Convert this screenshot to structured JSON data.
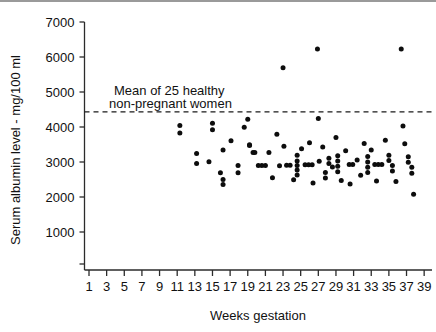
{
  "chart_data": {
    "type": "scatter",
    "title": "",
    "xlabel": "Weeks gestation",
    "ylabel": "Serum albumin level - mg/100 ml",
    "xlim": [
      0,
      40
    ],
    "ylim": [
      0,
      7000
    ],
    "grid": false,
    "legend": "none",
    "xticks": [
      1,
      3,
      5,
      7,
      9,
      11,
      13,
      15,
      17,
      19,
      21,
      23,
      25,
      27,
      29,
      31,
      33,
      35,
      37,
      39
    ],
    "xtick_labels": [
      "1",
      "3",
      "5",
      "7",
      "9",
      "11",
      "13",
      "15",
      "17",
      "19",
      "21",
      "23",
      "25",
      "27",
      "29",
      "31",
      "33",
      "35",
      "37",
      "39"
    ],
    "yticks": [
      1000,
      2000,
      3000,
      4000,
      5000,
      6000,
      7000
    ],
    "ytick_labels": [
      "1000",
      "2000",
      "3000",
      "4000",
      "5000",
      "6000",
      "7000"
    ],
    "annotations": [
      {
        "name": "mean-reference-label",
        "text_line1": "Mean of 25 healthy",
        "text_line2": "non-pregnant women",
        "x": 13.5,
        "y": 4900
      }
    ],
    "reference_lines": [
      {
        "name": "mean-non-pregnant-line",
        "orientation": "horizontal",
        "value": 4430,
        "style": "dashed",
        "label": "Mean of 25 healthy non-pregnant women"
      }
    ],
    "series": [
      {
        "name": "Serum albumin level",
        "marker": "filled-circle",
        "color": "#0d0d0d",
        "points": [
          [
            11.3,
            4040
          ],
          [
            11.3,
            3830
          ],
          [
            13.2,
            3240
          ],
          [
            13.2,
            2960
          ],
          [
            14.6,
            3010
          ],
          [
            15.0,
            4110
          ],
          [
            15.0,
            3920
          ],
          [
            15.9,
            2690
          ],
          [
            16.2,
            3340
          ],
          [
            16.2,
            2500
          ],
          [
            16.2,
            2360
          ],
          [
            17.1,
            3610
          ],
          [
            17.9,
            2900
          ],
          [
            17.9,
            2690
          ],
          [
            18.6,
            3990
          ],
          [
            19.0,
            4220
          ],
          [
            19.2,
            3490
          ],
          [
            19.2,
            3470
          ],
          [
            19.6,
            3270
          ],
          [
            19.8,
            3270
          ],
          [
            20.2,
            2900
          ],
          [
            20.6,
            2900
          ],
          [
            21.0,
            2900
          ],
          [
            21.4,
            3270
          ],
          [
            21.8,
            2550
          ],
          [
            22.3,
            3790
          ],
          [
            22.6,
            2890
          ],
          [
            23.0,
            5690
          ],
          [
            23.1,
            3450
          ],
          [
            23.4,
            2910
          ],
          [
            23.8,
            2910
          ],
          [
            24.2,
            2490
          ],
          [
            24.6,
            3190
          ],
          [
            24.6,
            3030
          ],
          [
            24.6,
            2900
          ],
          [
            24.6,
            2770
          ],
          [
            24.6,
            2630
          ],
          [
            25.1,
            3380
          ],
          [
            25.5,
            2920
          ],
          [
            25.9,
            2920
          ],
          [
            26.3,
            2920
          ],
          [
            26.0,
            3550
          ],
          [
            26.4,
            2400
          ],
          [
            26.9,
            6230
          ],
          [
            27.0,
            4240
          ],
          [
            27.1,
            3020
          ],
          [
            27.5,
            3430
          ],
          [
            27.8,
            2700
          ],
          [
            27.8,
            2540
          ],
          [
            28.2,
            3110
          ],
          [
            28.2,
            2960
          ],
          [
            28.6,
            2860
          ],
          [
            29.0,
            3700
          ],
          [
            29.2,
            3180
          ],
          [
            29.2,
            3030
          ],
          [
            29.2,
            2880
          ],
          [
            29.2,
            2720
          ],
          [
            29.6,
            2470
          ],
          [
            30.1,
            3320
          ],
          [
            30.5,
            2930
          ],
          [
            30.9,
            2930
          ],
          [
            30.6,
            2370
          ],
          [
            31.4,
            3060
          ],
          [
            31.8,
            2620
          ],
          [
            32.2,
            3530
          ],
          [
            32.6,
            3160
          ],
          [
            32.6,
            3000
          ],
          [
            32.6,
            2850
          ],
          [
            32.6,
            2700
          ],
          [
            33.0,
            3340
          ],
          [
            33.4,
            2930
          ],
          [
            33.8,
            2930
          ],
          [
            34.2,
            2930
          ],
          [
            33.6,
            2460
          ],
          [
            34.6,
            3620
          ],
          [
            35.0,
            3190
          ],
          [
            35.0,
            3040
          ],
          [
            35.4,
            2900
          ],
          [
            35.4,
            2740
          ],
          [
            35.8,
            2440
          ],
          [
            36.4,
            6230
          ],
          [
            36.6,
            4030
          ],
          [
            36.8,
            3520
          ],
          [
            37.2,
            3150
          ],
          [
            37.2,
            2990
          ],
          [
            37.6,
            2850
          ],
          [
            37.6,
            2680
          ],
          [
            37.8,
            2080
          ]
        ]
      }
    ]
  },
  "axes": {
    "y_title": "Serum albumin level - mg/100 ml",
    "x_title": "Weeks gestation"
  }
}
